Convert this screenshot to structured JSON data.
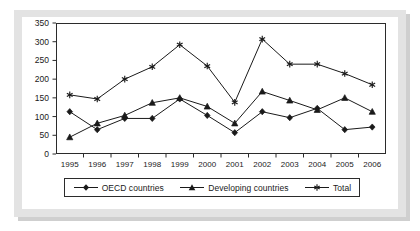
{
  "chart_data": {
    "type": "line",
    "title": "",
    "subtitle": "",
    "xlabel": "",
    "ylabel": "",
    "categories": [
      "1995",
      "1996",
      "1997",
      "1998",
      "1999",
      "2000",
      "2001",
      "2002",
      "2003",
      "2004",
      "2005",
      "2006"
    ],
    "x": [
      1995,
      1996,
      1997,
      1998,
      1999,
      2000,
      2001,
      2002,
      2003,
      2004,
      2005,
      2006
    ],
    "ylim": [
      0,
      350
    ],
    "xlim": [
      1995,
      2006
    ],
    "yticks": [
      0,
      50,
      100,
      150,
      200,
      250,
      300,
      350
    ],
    "ytick_labels": [
      "0",
      "50",
      "100",
      "150",
      "200",
      "250",
      "300",
      "350"
    ],
    "grid": false,
    "legend_position": "bottom",
    "series": [
      {
        "name": "OECD countries",
        "marker": "diamond",
        "values": [
          113,
          65,
          95,
          95,
          147,
          103,
          57,
          113,
          97,
          122,
          65,
          72
        ]
      },
      {
        "name": "Developing countries",
        "marker": "triangle",
        "values": [
          45,
          82,
          103,
          137,
          150,
          127,
          82,
          167,
          143,
          118,
          150,
          113
        ]
      },
      {
        "name": "Total",
        "marker": "star",
        "values": [
          158,
          147,
          200,
          233,
          292,
          235,
          138,
          307,
          240,
          240,
          215,
          185
        ]
      }
    ]
  },
  "legend": {
    "items": [
      {
        "label": "OECD countries",
        "marker": "diamond"
      },
      {
        "label": "Developing countries",
        "marker": "triangle"
      },
      {
        "label": "Total",
        "marker": "star"
      }
    ]
  },
  "colors": {
    "line": "#1a1a1a",
    "axis": "#2b2b2b",
    "plot_background": "#ffffff",
    "mount": "#e3e3e3",
    "shadow": "#cfcfcf"
  }
}
